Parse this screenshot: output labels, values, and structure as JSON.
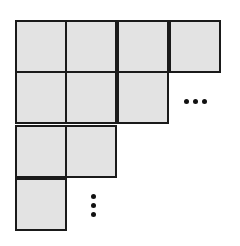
{
  "diagram": {
    "type": "staircase-grid",
    "cell_fill": "#e3e3e3",
    "line_color": "#1a1a1a",
    "rows": [
      {
        "row": 1,
        "cells": 4
      },
      {
        "row": 2,
        "cells": 3
      },
      {
        "row": 3,
        "cells": 2
      },
      {
        "row": 4,
        "cells": 1
      }
    ],
    "continuations": [
      {
        "name": "horizontal-ellipsis",
        "glyph": "…",
        "position": "row 2, right of last cell"
      },
      {
        "name": "vertical-ellipsis",
        "glyph": "⋮",
        "position": "row 4, right of last cell"
      }
    ]
  }
}
